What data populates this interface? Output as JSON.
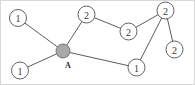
{
  "figure": {
    "width": 195,
    "height": 85,
    "background_color": "#ffffff",
    "border_color": "#d8d8d8",
    "edge_color": "#4a4a4a",
    "node_outline_color": "#4f4f4f",
    "hub_fill_color": "#a8a8a8"
  },
  "nodes": [
    {
      "id": "n1",
      "label": "1",
      "cx": 18,
      "cy": 18,
      "r": 8.5,
      "type": "open",
      "name": "node-upper-left-1"
    },
    {
      "id": "n2",
      "label": "1",
      "cx": 20,
      "cy": 70.5,
      "r": 8.5,
      "type": "open",
      "name": "node-lower-left-1"
    },
    {
      "id": "nA",
      "label": "A",
      "cx": 63,
      "cy": 51,
      "r": 7.0,
      "type": "filled",
      "name": "node-hub-a"
    },
    {
      "id": "n3",
      "label": "2",
      "cx": 86.5,
      "cy": 14.5,
      "r": 8.5,
      "type": "open",
      "name": "node-top-2"
    },
    {
      "id": "n4",
      "label": "2",
      "cx": 128.5,
      "cy": 31.5,
      "r": 8.5,
      "type": "open",
      "name": "node-middle-2"
    },
    {
      "id": "n5",
      "label": "2",
      "cx": 165.5,
      "cy": 10.5,
      "r": 8.5,
      "type": "open",
      "name": "node-top-right-2"
    },
    {
      "id": "n6",
      "label": "2",
      "cx": 174.5,
      "cy": 49.5,
      "r": 8.5,
      "type": "open",
      "name": "node-right-2"
    },
    {
      "id": "n7",
      "label": "1",
      "cx": 136.5,
      "cy": 67.5,
      "r": 8.5,
      "type": "open",
      "name": "node-bottom-1"
    }
  ],
  "edges": [
    {
      "from": "n1",
      "to": "nA",
      "name": "edge-upper-left-to-hub"
    },
    {
      "from": "n2",
      "to": "nA",
      "name": "edge-lower-left-to-hub"
    },
    {
      "from": "nA",
      "to": "n3",
      "name": "edge-hub-to-top-2"
    },
    {
      "from": "nA",
      "to": "n7",
      "name": "edge-hub-to-bottom-1"
    },
    {
      "from": "n3",
      "to": "n4",
      "name": "edge-top-2-to-middle-2"
    },
    {
      "from": "n4",
      "to": "n5",
      "name": "edge-middle-2-to-top-right-2"
    },
    {
      "from": "n5",
      "to": "n7",
      "name": "edge-top-right-2-to-bottom-1"
    },
    {
      "from": "n5",
      "to": "n6",
      "name": "edge-top-right-2-to-right-2"
    }
  ],
  "hub_annotation": {
    "text": "A",
    "x": 68,
    "y": 65
  }
}
